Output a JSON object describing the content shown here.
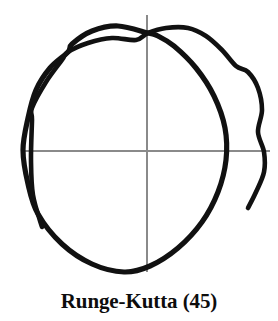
{
  "figure": {
    "caption": "Runge-Kutta (45)",
    "method_name": "Runge-Kutta",
    "method_order": "(45)",
    "background_color": "#ffffff",
    "stroke_color": "#111111",
    "axis_color": "#8a8a8a"
  },
  "chart_data": {
    "type": "line",
    "title": "Runge-Kutta (45)",
    "xlabel": "",
    "ylabel": "",
    "grid": false,
    "legend": null,
    "axes": {
      "origin_px": [
        147,
        151
      ],
      "x_axis_px": {
        "y": 151,
        "x_start": 22,
        "x_end": 270
      },
      "y_axis_px": {
        "x": 147,
        "y_start": 15,
        "y_end": 272
      },
      "xlim": [
        -1.3,
        1.3
      ],
      "ylim": [
        -1.45,
        1.45
      ]
    },
    "series": [
      {
        "name": "orbit-inner-loop",
        "closed": true,
        "points_px": [
          [
            148,
            33
          ],
          [
            118,
            26
          ],
          [
            92,
            31
          ],
          [
            72,
            44
          ],
          [
            68,
            52
          ],
          [
            50,
            68
          ],
          [
            36,
            90
          ],
          [
            28,
            118
          ],
          [
            23,
            150
          ],
          [
            28,
            184
          ],
          [
            38,
            214
          ],
          [
            62,
            244
          ],
          [
            92,
            264
          ],
          [
            124,
            272
          ],
          [
            150,
            266
          ],
          [
            178,
            248
          ],
          [
            202,
            222
          ],
          [
            218,
            192
          ],
          [
            226,
            160
          ],
          [
            225,
            128
          ],
          [
            214,
            96
          ],
          [
            196,
            68
          ],
          [
            174,
            46
          ],
          [
            158,
            36
          ],
          [
            148,
            33
          ]
        ]
      },
      {
        "name": "orbit-outer-arc",
        "closed": false,
        "points_px": [
          [
            42,
            227
          ],
          [
            33,
            195
          ],
          [
            31,
            160
          ],
          [
            32,
            120
          ],
          [
            32,
            108
          ],
          [
            46,
            82
          ],
          [
            62,
            60
          ],
          [
            68,
            52
          ],
          [
            88,
            43
          ],
          [
            112,
            38
          ],
          [
            136,
            40
          ],
          [
            148,
            33
          ],
          [
            166,
            28
          ],
          [
            188,
            28
          ],
          [
            206,
            36
          ],
          [
            222,
            50
          ],
          [
            236,
            66
          ],
          [
            248,
            72
          ],
          [
            258,
            88
          ],
          [
            262,
            110
          ],
          [
            258,
            132
          ],
          [
            264,
            152
          ],
          [
            264,
            172
          ],
          [
            256,
            192
          ],
          [
            248,
            208
          ]
        ]
      }
    ],
    "features": [
      {
        "name": "upper-left-crossing",
        "point_px": [
          68,
          52
        ]
      },
      {
        "name": "upper-right-crossing",
        "point_px": [
          148,
          33
        ]
      },
      {
        "name": "trajectory-start-end",
        "point_px": [
          42,
          227
        ]
      },
      {
        "name": "trajectory-finish-end",
        "point_px": [
          248,
          208
        ]
      },
      {
        "name": "bottom-of-orbit",
        "point_px": [
          124,
          272
        ]
      },
      {
        "name": "leftmost-of-orbit",
        "point_px": [
          23,
          150
        ]
      },
      {
        "name": "rightmost-of-orbit",
        "point_px": [
          264,
          160
        ]
      }
    ]
  }
}
